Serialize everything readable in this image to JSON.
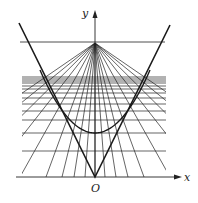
{
  "labels": {
    "x_axis": "x",
    "y_axis": "y",
    "origin": "O"
  },
  "geometry": {
    "origin": [
      95,
      177
    ],
    "apex": [
      95,
      43
    ],
    "grid_left": 22,
    "grid_right": 166,
    "top_line_y": 42,
    "top_line_x": [
      20,
      165
    ],
    "horizontal_lines_y": [
      77,
      79,
      81,
      83,
      86,
      89,
      93,
      98,
      104,
      111,
      120,
      133,
      151
    ],
    "fan_bottom_x": [
      -100,
      -70,
      -40,
      -10,
      20,
      46,
      62,
      74,
      85,
      95,
      105,
      116,
      128,
      144,
      170,
      200,
      230,
      260,
      290
    ],
    "v_left_end": [
      19,
      23
    ],
    "v_right_end": [
      170,
      25
    ],
    "parabola": {
      "vertex": [
        95,
        133
      ],
      "through": [
        [
          40,
          70
        ],
        [
          150,
          70
        ]
      ]
    }
  },
  "colors": {
    "line": "#222222",
    "thick": "#1a1a1a",
    "background": "#ffffff"
  }
}
